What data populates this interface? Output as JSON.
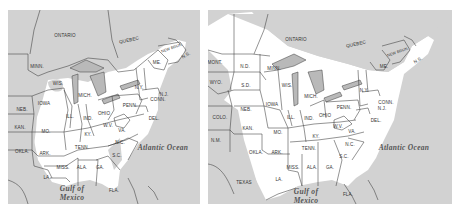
{
  "colors": {
    "shaded": "#d2d2d2",
    "unshaded": "#ffffff",
    "border": "#3a3a3a",
    "label": "#333333",
    "lakes": "#b9b9b9"
  },
  "maps": [
    {
      "id": "left",
      "regions": {
        "canada": [
          "ONTARIO",
          "QUEBEC",
          "N.S."
        ],
        "states": [
          "MINN.",
          "WIS.",
          "MICH.",
          "IOWA",
          "NEB.",
          "KAN.",
          "OKLA.",
          "MO.",
          "ILL.",
          "IND.",
          "OHIO",
          "KY.",
          "W.V.",
          "VA.",
          "N.C.",
          "S.C.",
          "TENN.",
          "ARK.",
          "LA.",
          "MISS.",
          "ALA.",
          "GA.",
          "FLA.",
          "PENN.",
          "N.Y.",
          "ME.",
          "NEW BRUN.",
          "N.J.",
          "CONN.",
          "DEL."
        ]
      },
      "water": {
        "ocean": "Atlantic Ocean",
        "gulf_line1": "Gulf of",
        "gulf_line2": "Mexico"
      }
    },
    {
      "id": "right",
      "regions": {
        "canada": [
          "ONTARIO",
          "QUEBEC",
          "N.S."
        ],
        "states": [
          "MONT.",
          "WYO.",
          "COLO.",
          "N.M.",
          "TEXAS",
          "N.D.",
          "S.D.",
          "NEB.",
          "KAN.",
          "OKLA.",
          "MINN.",
          "WIS.",
          "MICH.",
          "IOWA",
          "ILL.",
          "IND.",
          "OHIO",
          "MO.",
          "ARK.",
          "LA.",
          "KY.",
          "TENN.",
          "MISS.",
          "ALA.",
          "GA.",
          "FLA.",
          "W.V.",
          "VA.",
          "N.C.",
          "S.C.",
          "PENN.",
          "N.Y.",
          "ME.",
          "NEW BRUN.",
          "N.J.",
          "CONN.",
          "DEL."
        ]
      },
      "water": {
        "ocean": "Atlantic Ocean",
        "gulf_line1": "Gulf of",
        "gulf_line2": "Mexico"
      }
    }
  ],
  "labels_left": {
    "ontario": "ONTARIO",
    "quebec": "QUEBEC",
    "ns": "N.S.",
    "newbrun": "NEW BRUN.",
    "minn": "MINN.",
    "wis": "WIS.",
    "mich": "MICH.",
    "ny": "N.Y.",
    "me": "ME.",
    "iowa": "IOWA",
    "neb": "NEB.",
    "ill": "ILL.",
    "ind": "IND.",
    "ohio": "OHIO",
    "penn": "PENN.",
    "nj": "N.J.",
    "conn": "CONN.",
    "del": "DEL.",
    "kan": "KAN.",
    "mo": "MO.",
    "ky": "KY.",
    "wv": "W.V.",
    "va": "VA.",
    "okla": "OKLA.",
    "ark": "ARK.",
    "tenn": "TENN.",
    "nc": "N.C.",
    "sc": "S.C.",
    "la": "LA.",
    "miss": "MISS.",
    "ala": "ALA.",
    "ga": "GA.",
    "fla": "FLA.",
    "ocean": "Atlantic Ocean",
    "gulf1": "Gulf of",
    "gulf2": "Mexico"
  },
  "labels_right": {
    "ontario": "ONTARIO",
    "quebec": "QUEBEC",
    "ns": "N.S.",
    "newbrun": "NEW BRUN.",
    "mont": "MONT.",
    "wyo": "WYO.",
    "colo": "COLO.",
    "nm": "N.M.",
    "texas": "TEXAS",
    "nd": "N.D.",
    "sd": "S.D.",
    "neb": "NEB.",
    "kan": "KAN.",
    "okla": "OKLA.",
    "minn": "MINN.",
    "wis": "WIS.",
    "mich": "MICH.",
    "iowa": "IOWA",
    "ill": "ILL.",
    "ind": "IND.",
    "ohio": "OHIO",
    "mo": "MO.",
    "ark": "ARK.",
    "la": "LA.",
    "ky": "KY.",
    "tenn": "TENN.",
    "miss": "MISS.",
    "ala": "ALA.",
    "ga": "GA.",
    "fla": "FLA.",
    "wv": "W.V.",
    "va": "VA.",
    "nc": "N.C.",
    "sc": "S.C.",
    "penn": "PENN.",
    "ny": "N.Y.",
    "me": "ME.",
    "nj": "N.J.",
    "conn": "CONN.",
    "del": "DEL.",
    "ocean": "Atlantic Ocean",
    "gulf1": "Gulf of",
    "gulf2": "Mexico"
  }
}
